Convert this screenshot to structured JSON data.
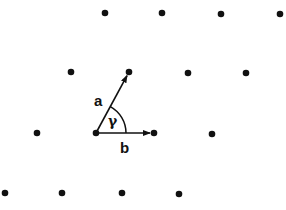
{
  "diagram": {
    "type": "2D lattice with unit cell vectors",
    "lattice_points": [
      {
        "x": 105,
        "y": 13
      },
      {
        "x": 162,
        "y": 13
      },
      {
        "x": 221,
        "y": 14
      },
      {
        "x": 280,
        "y": 14
      },
      {
        "x": 71,
        "y": 72
      },
      {
        "x": 129,
        "y": 72
      },
      {
        "x": 188,
        "y": 73
      },
      {
        "x": 246,
        "y": 73
      },
      {
        "x": 37,
        "y": 133
      },
      {
        "x": 96,
        "y": 133
      },
      {
        "x": 154,
        "y": 133
      },
      {
        "x": 212,
        "y": 134
      },
      {
        "x": 5,
        "y": 193
      },
      {
        "x": 62,
        "y": 193
      },
      {
        "x": 122,
        "y": 193
      },
      {
        "x": 179,
        "y": 194
      }
    ],
    "origin": {
      "x": 96,
      "y": 133
    },
    "vectors": {
      "a": {
        "label": "a",
        "to": {
          "x": 129,
          "y": 72
        }
      },
      "b": {
        "label": "b",
        "to": {
          "x": 154,
          "y": 133
        }
      }
    },
    "angle_label": "γ",
    "color": "#111111"
  }
}
